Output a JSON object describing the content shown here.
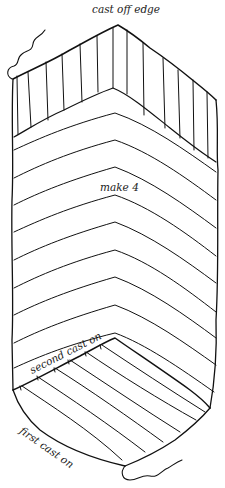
{
  "diagram": {
    "type": "knitting construction schematic",
    "labels": {
      "cast_off_edge": "cast off edge",
      "make": "make 4",
      "second_cast_on": "second cast on",
      "first_cast_on": "first cast on"
    },
    "colors": {
      "line": "#111111",
      "background": "#ffffff"
    },
    "sections": [
      {
        "name": "cast-off-band",
        "stitch_direction": "vertical",
        "stripe_count": 12
      },
      {
        "name": "chevron-body",
        "stitch_direction": "chevron rows",
        "row_count": 10
      },
      {
        "name": "first-cast-on-panel",
        "stitch_direction": "diagonal",
        "stripe_count": 8
      }
    ]
  }
}
